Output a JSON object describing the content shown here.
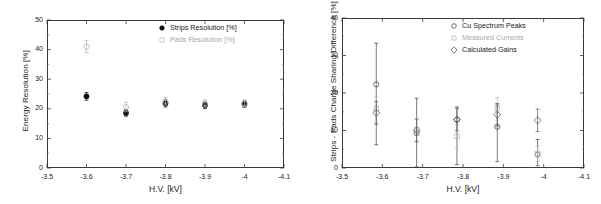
{
  "figure": {
    "background": "#ffffff",
    "panel_count": 2
  },
  "chart_data": [
    {
      "type": "scatter",
      "title": "",
      "panel": "left",
      "xlabel": "H.V. [kV]",
      "ylabel": "Energy Resolution [%]",
      "xlim": [
        -3.5,
        -4.1
      ],
      "ylim": [
        0,
        50
      ],
      "xticks": [
        -3.5,
        -3.6,
        -3.7,
        -3.8,
        -3.9,
        -4,
        -4.1
      ],
      "xticklabels": [
        "-3.5",
        "-3.6",
        "-3.7",
        "-3.8",
        "-3.9",
        "-4",
        "-4.1"
      ],
      "yticks": [
        0,
        10,
        20,
        30,
        40,
        50
      ],
      "yticklabels": [
        "0",
        "10",
        "20",
        "30",
        "40",
        "50"
      ],
      "grid": false,
      "legend_position": "top-right",
      "series": [
        {
          "name": "Strips Resolution  [%]",
          "marker": "filled-circle",
          "color": "#111111",
          "x": [
            -3.6,
            -3.7,
            -3.8,
            -3.9,
            -4.0
          ],
          "values": [
            24.2,
            18.6,
            21.8,
            21.2,
            21.6
          ],
          "yerr": [
            1.3,
            1.1,
            1.2,
            1.1,
            1.1
          ]
        },
        {
          "name": "Pads Resolution  [%]",
          "marker": "open-circle",
          "color": "#b4b4b4",
          "x": [
            -3.6,
            -3.7,
            -3.8,
            -3.9,
            -4.0
          ],
          "values": [
            41.0,
            20.6,
            22.6,
            21.8,
            21.9
          ],
          "yerr": [
            2.0,
            1.6,
            1.3,
            1.2,
            1.1
          ]
        }
      ]
    },
    {
      "type": "scatter",
      "title": "",
      "panel": "right",
      "xlabel": "H.V. [kV]",
      "ylabel": "Strips - Pads Charge Sharing Difference [%]",
      "xlim": [
        -3.5,
        -4.1
      ],
      "ylim": [
        0,
        40
      ],
      "xticks": [
        -3.5,
        -3.6,
        -3.7,
        -3.8,
        -3.9,
        -4,
        -4.1
      ],
      "xticklabels": [
        "-3.5",
        "-3.6",
        "-3.7",
        "-3.8",
        "-3.9",
        "-4",
        "-4.1"
      ],
      "yticks": [
        0,
        10,
        20,
        30,
        40
      ],
      "yticklabels": [
        "0",
        "10",
        "20",
        "30",
        "40"
      ],
      "grid": false,
      "legend_position": "top-right",
      "series": [
        {
          "name": "Cu Spectrum Peaks",
          "marker": "open-circle",
          "color": "#444444",
          "x": [
            -3.585,
            -3.685,
            -3.785,
            -3.885,
            -3.985
          ],
          "values": [
            22.3,
            9.3,
            12.9,
            11.0,
            3.6
          ],
          "yerr_lo": [
            16.1,
            9.0,
            12.0,
            9.3,
            3.0
          ],
          "yerr_hi": [
            11.0,
            9.3,
            3.4,
            5.8,
            4.0
          ]
        },
        {
          "name": "Measured Currents",
          "marker": "open-square",
          "color": "#b4b4b4",
          "x": [
            -3.585,
            -3.685,
            -3.785,
            -3.885,
            -3.985
          ],
          "values": [
            15.8,
            10.3,
            8.5,
            15.8,
            3.8
          ],
          "yerr_lo": [
            3.8,
            3.0,
            3.0,
            3.0,
            2.0
          ],
          "yerr_hi": [
            3.2,
            3.0,
            3.0,
            3.0,
            2.0
          ]
        },
        {
          "name": "Calculated Gains",
          "marker": "open-diamond",
          "color": "#555555",
          "x": [
            -3.585,
            -3.685,
            -3.785,
            -3.885,
            -3.985
          ],
          "values": [
            14.7,
            10.0,
            12.9,
            14.2,
            12.7
          ],
          "yerr_lo": [
            3.0,
            3.0,
            3.0,
            3.0,
            3.0
          ],
          "yerr_hi": [
            3.0,
            3.0,
            3.0,
            3.0,
            3.0
          ]
        }
      ]
    }
  ]
}
